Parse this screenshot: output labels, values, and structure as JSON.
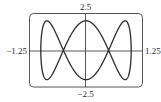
{
  "chart_data": {
    "type": "line",
    "subtype": "parametric",
    "title": "",
    "xlabel": "",
    "ylabel": "",
    "xlim": [
      -1.25,
      1.25
    ],
    "ylim": [
      -2.5,
      2.5
    ],
    "grid": false,
    "legend": null,
    "tick_labels": {
      "x_min": "−1.25",
      "x_max": "1.25",
      "y_max": "2.5",
      "y_min": "−2.5"
    },
    "series": [
      {
        "name": "curve",
        "equation": "x = cos t, y = 2 sin 3t",
        "t_range": [
          0,
          6.2832
        ],
        "x_amp": 1,
        "y_amp": 2,
        "x_freq": 1,
        "y_freq": 3,
        "color": "#2a2a2a"
      }
    ]
  },
  "colors": {
    "frame": "#555555",
    "axis": "#444444",
    "curve": "#2a2a2a"
  }
}
